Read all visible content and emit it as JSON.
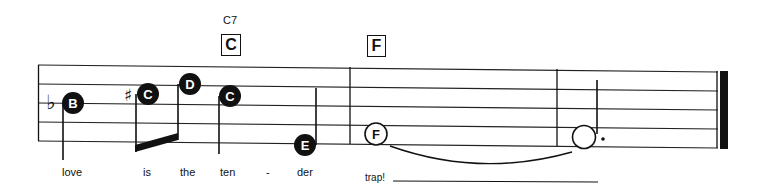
{
  "chords": [
    {
      "name": "C7",
      "box": "C",
      "x": 221,
      "name_y": 15,
      "box_y": 34
    },
    {
      "name": "",
      "box": "F",
      "x": 367,
      "name_y": 15,
      "box_y": 35
    }
  ],
  "key_signature": "♭",
  "notes": [
    {
      "letter": "B",
      "cx": 73,
      "cy": 103,
      "filled": true,
      "accidental": "",
      "stem_x": 63,
      "stem_y1": 103,
      "stem_y2": 160
    },
    {
      "letter": "C",
      "cx": 148,
      "cy": 94,
      "filled": true,
      "accidental": "♯",
      "stem_x": 136,
      "stem_y1": 94,
      "stem_y2": 150
    },
    {
      "letter": "D",
      "cx": 190,
      "cy": 84,
      "filled": true,
      "accidental": "",
      "stem_x": 178,
      "stem_y1": 84,
      "stem_y2": 140
    },
    {
      "letter": "C",
      "cx": 230,
      "cy": 96,
      "filled": true,
      "accidental": "",
      "stem_x": 219,
      "stem_y1": 96,
      "stem_y2": 152
    },
    {
      "letter": "E",
      "cx": 305,
      "cy": 145,
      "filled": true,
      "accidental": "",
      "stem_x": 316,
      "stem_y1": 145,
      "stem_y2": 88
    },
    {
      "letter": "F",
      "cx": 376,
      "cy": 134,
      "filled": false,
      "accidental": "",
      "stem_x": null
    },
    {
      "letter": "",
      "cx": 583,
      "cy": 137,
      "filled": false,
      "accidental": "",
      "stem_x": 597,
      "stem_y1": 134,
      "stem_y2": 80,
      "dotted": true
    }
  ],
  "lyrics": [
    {
      "text": "love",
      "x": 62
    },
    {
      "text": "is",
      "x": 143
    },
    {
      "text": "the",
      "x": 180
    },
    {
      "text": "ten",
      "x": 220
    },
    {
      "text": "-",
      "x": 266
    },
    {
      "text": "der",
      "x": 297
    },
    {
      "text": "trap!",
      "x": 365
    }
  ],
  "colors": {
    "ink": "#111111",
    "paper": "#ffffff"
  }
}
